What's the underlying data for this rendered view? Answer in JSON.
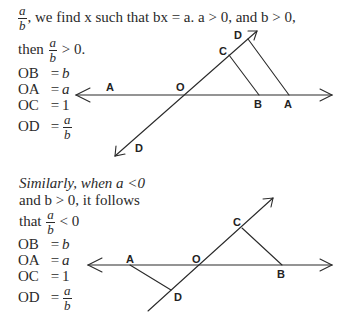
{
  "intro": {
    "fraction": {
      "num": "a",
      "den": "b"
    },
    "line1_text": ", we find x such that bx = a. a > 0, and b > 0,",
    "line2_prefix": "then",
    "line2_fraction": {
      "num": "a",
      "den": "b"
    },
    "line2_suffix": "> 0."
  },
  "case1": {
    "equations": [
      {
        "lhs": "OB",
        "op": "=",
        "rhs": "b"
      },
      {
        "lhs": "OA",
        "op": "=",
        "rhs": "a"
      },
      {
        "lhs": "OC",
        "op": "=",
        "rhs": "1"
      },
      {
        "lhs": "OD",
        "op": "=",
        "rhs_fraction": {
          "num": "a",
          "den": "b"
        }
      }
    ],
    "diagram": {
      "labels": {
        "A_left": "A",
        "O": "O",
        "B": "B",
        "A": "A",
        "C": "C",
        "D_top": "D",
        "D_bottom": "D"
      }
    }
  },
  "case2": {
    "line1": "Similarly, when a <0",
    "line2": "and b > 0, it follows",
    "line3_prefix": "that",
    "line3_fraction": {
      "num": "a",
      "den": "b"
    },
    "line3_suffix": "< 0",
    "equations": [
      {
        "lhs": "OB",
        "op": "=",
        "rhs": "b"
      },
      {
        "lhs": "OA",
        "op": "=",
        "rhs": "a"
      },
      {
        "lhs": "OC",
        "op": "=",
        "rhs": "1"
      },
      {
        "lhs": "OD",
        "op": "=",
        "rhs_fraction": {
          "num": "a",
          "den": "b"
        }
      }
    ],
    "diagram": {
      "labels": {
        "A": "A",
        "O": "O",
        "B": "B",
        "C": "C",
        "D": "D"
      }
    }
  }
}
